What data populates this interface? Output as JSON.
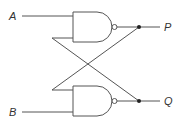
{
  "diagram": {
    "type": "NAND SR latch (cross-coupled NAND gates)",
    "inputs": [
      {
        "label": "A",
        "gate": "top"
      },
      {
        "label": "B",
        "gate": "bottom"
      }
    ],
    "outputs": [
      {
        "label": "P",
        "gate": "top"
      },
      {
        "label": "Q",
        "gate": "bottom"
      }
    ],
    "gates": [
      {
        "id": "nand-top",
        "kind": "NAND"
      },
      {
        "id": "nand-bottom",
        "kind": "NAND"
      }
    ],
    "connections": [
      {
        "from": "P",
        "to": "nand-bottom input 1"
      },
      {
        "from": "Q",
        "to": "nand-top input 2"
      }
    ],
    "colors": {
      "line": "#555555",
      "junction": "#222222",
      "text": "#333333"
    }
  }
}
